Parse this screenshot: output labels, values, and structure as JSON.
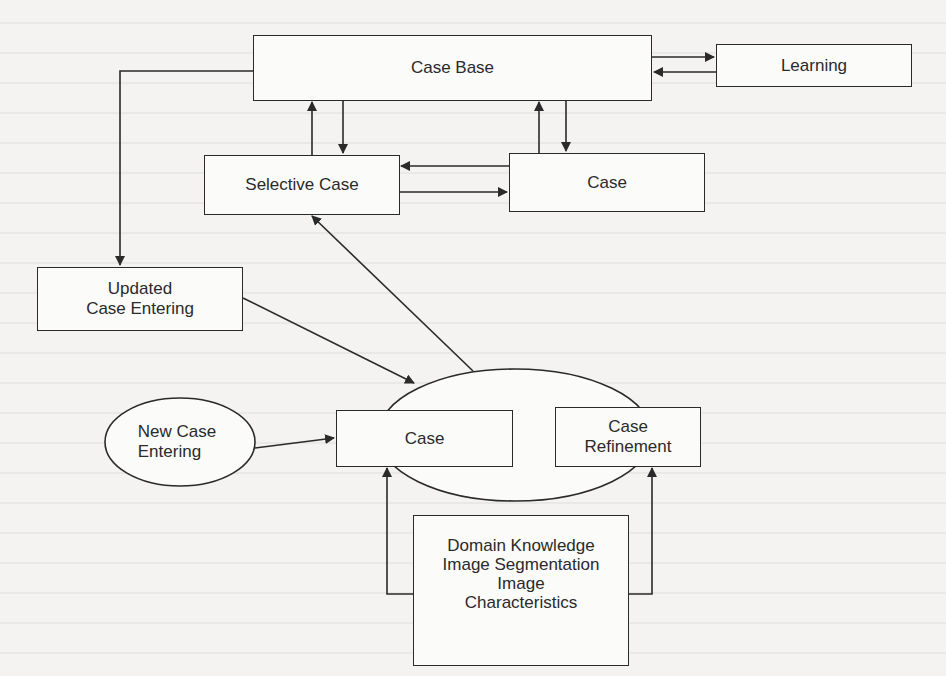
{
  "diagram": {
    "type": "flowchart",
    "nodes": {
      "case_base": {
        "label": "Case Base",
        "shape": "rectangle"
      },
      "learning": {
        "label": "Learning",
        "shape": "rectangle"
      },
      "selective_case": {
        "label": "Selective Case",
        "shape": "rectangle"
      },
      "case_top": {
        "label": "Case",
        "shape": "rectangle"
      },
      "updated_case_entering": {
        "label": "Updated\nCase Entering",
        "shape": "rectangle"
      },
      "new_case_entering": {
        "label": "New Case\nEntering",
        "shape": "ellipse"
      },
      "case_center": {
        "label": "Case",
        "shape": "rectangle"
      },
      "case_refinement": {
        "label": "Case\nRefinement",
        "shape": "rectangle"
      },
      "domain_knowledge": {
        "label": "Domain Knowledge\nImage Segmentation\nImage\nCharacteristics",
        "shape": "rectangle"
      },
      "processing_ellipse": {
        "label": "",
        "shape": "ellipse"
      }
    },
    "edges": [
      {
        "from": "case_base",
        "to": "learning"
      },
      {
        "from": "learning",
        "to": "case_base"
      },
      {
        "from": "selective_case",
        "to": "case_base"
      },
      {
        "from": "case_base",
        "to": "selective_case"
      },
      {
        "from": "case_top",
        "to": "case_base"
      },
      {
        "from": "case_base",
        "to": "case_top"
      },
      {
        "from": "case_top",
        "to": "selective_case"
      },
      {
        "from": "selective_case",
        "to": "case_top"
      },
      {
        "from": "case_base",
        "to": "updated_case_entering"
      },
      {
        "from": "updated_case_entering",
        "to": "processing_ellipse"
      },
      {
        "from": "processing_ellipse",
        "to": "selective_case"
      },
      {
        "from": "new_case_entering",
        "to": "case_center"
      },
      {
        "from": "domain_knowledge",
        "to": "case_center"
      },
      {
        "from": "domain_knowledge",
        "to": "case_refinement"
      }
    ],
    "colors": {
      "line": "#2a2a2a",
      "background": "#f4f3f1",
      "box_fill": "#fbfbfa"
    }
  }
}
